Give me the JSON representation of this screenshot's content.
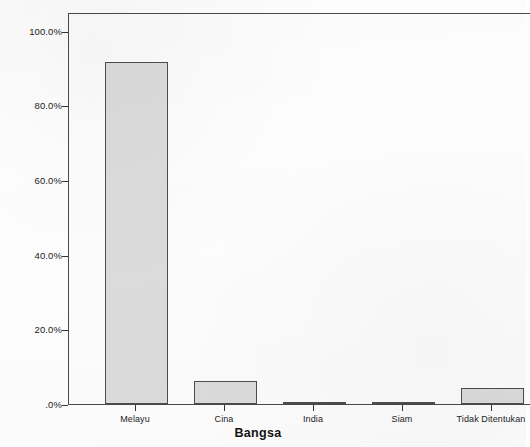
{
  "chart_data": {
    "type": "bar",
    "title": "",
    "subtitle": "",
    "xlabel": "Bangsa",
    "ylabel": "Percent",
    "categories": [
      "Melayu",
      "Cina",
      "India",
      "Siam",
      "Tidak Ditentukan"
    ],
    "values": [
      91.6,
      6.2,
      0.6,
      0.5,
      4.3
    ],
    "value_labels": [
      "",
      "",
      "",
      "",
      ""
    ],
    "ylim": [
      0,
      105
    ],
    "ytick_values": [
      0,
      20,
      40,
      60,
      80,
      100
    ],
    "ytick_labels": [
      ".0%",
      "20.0%",
      "40.0%",
      "60.0%",
      "80.0%",
      "100.0%"
    ],
    "grid": false,
    "legend": null,
    "legend_position": "none",
    "series": [
      {
        "name": "Percent",
        "values": [
          91.6,
          6.2,
          0.6,
          0.5,
          4.3
        ]
      }
    ],
    "colors": {
      "bar_fill": "#dcdcdc",
      "bar_border": "#4d4d4d",
      "axis": "#4a4a4a",
      "text": "#1c1c1c",
      "background": "#fefefe"
    }
  }
}
